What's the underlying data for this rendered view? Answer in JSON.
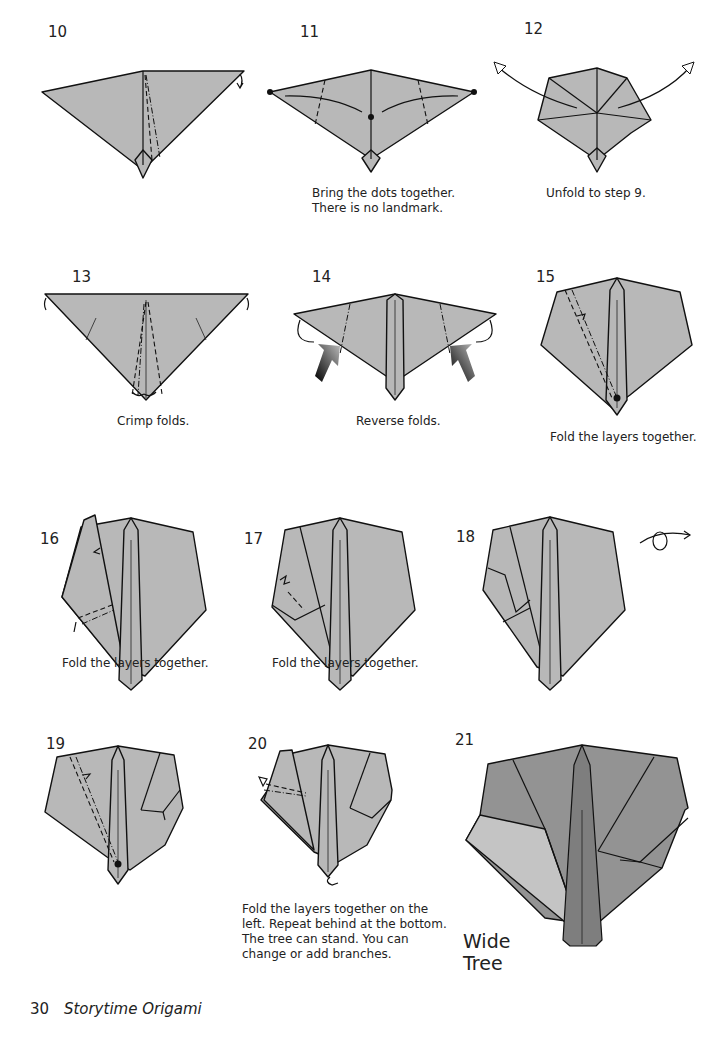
{
  "page": {
    "footer": {
      "page_number": "30",
      "book_title": "Storytime Origami"
    },
    "colors": {
      "paper": "#b8b8b8",
      "paper_dark": "#8f8f8f",
      "paper_light": "#c6c6c6",
      "trunk": "#7e7e7e",
      "ink": "#111111"
    }
  },
  "steps": [
    {
      "number": "10",
      "caption": ""
    },
    {
      "number": "11",
      "caption_lines": [
        "Bring the dots together.",
        "There is no landmark."
      ]
    },
    {
      "number": "12",
      "caption": "Unfold to step 9."
    },
    {
      "number": "13",
      "caption": "Crimp folds."
    },
    {
      "number": "14",
      "caption": "Reverse folds."
    },
    {
      "number": "15",
      "caption": "Fold the layers together."
    },
    {
      "number": "16",
      "caption": "Fold the layers together."
    },
    {
      "number": "17",
      "caption": "Fold the layers together."
    },
    {
      "number": "18",
      "caption": "",
      "icon": "turn-over-icon"
    },
    {
      "number": "19",
      "caption": ""
    },
    {
      "number": "20",
      "caption_lines": [
        "Fold the layers together on the",
        "left. Repeat behind at the bottom.",
        "The tree can stand. You can",
        "change or add branches."
      ]
    },
    {
      "number": "21",
      "caption": "",
      "result_title": "Wide Tree"
    }
  ]
}
